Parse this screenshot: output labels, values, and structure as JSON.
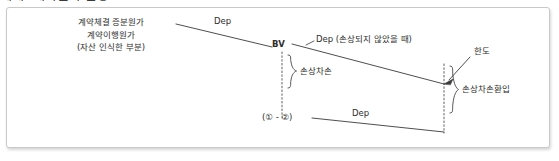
{
  "page": {
    "header_fragment": "예제) 계약원가 손상",
    "background": "#ffffff",
    "frame_border_color": "#c9c9c9",
    "line_color": "#3a3a3a"
  },
  "diagram": {
    "type": "accounting-timeline-diagram",
    "left_block": {
      "line1": "계약체결 증분원가",
      "line2": "계약이행원가",
      "line3": "(자산 인식한 부분)"
    },
    "labels": {
      "dep_top": "Dep",
      "bv": "BV",
      "dep_no_impairment": "Dep (손상되지 않았을 때)",
      "limit": "한도",
      "impairment_loss": "손상차손",
      "impairment_reversal": "손상차손환입",
      "residual_expr": "(① - ②)",
      "dep_bottom": "Dep"
    }
  }
}
